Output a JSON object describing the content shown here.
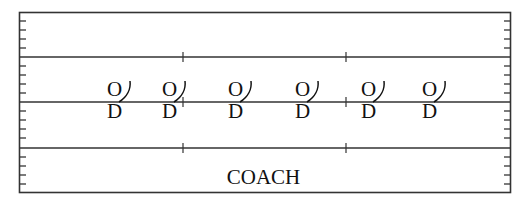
{
  "diagram": {
    "type": "field-formation",
    "field": {
      "border_color": "#333333",
      "lines_y": [
        57,
        102,
        148
      ],
      "center_ticks_x": [
        183,
        346
      ]
    },
    "players": [
      {
        "offense": "O",
        "defense": "D",
        "x": 117
      },
      {
        "offense": "O",
        "defense": "D",
        "x": 172
      },
      {
        "offense": "O",
        "defense": "D",
        "x": 238
      },
      {
        "offense": "O",
        "defense": "D",
        "x": 305
      },
      {
        "offense": "O",
        "defense": "D",
        "x": 371
      },
      {
        "offense": "O",
        "defense": "D",
        "x": 432
      }
    ],
    "coach_label": "COACH"
  }
}
